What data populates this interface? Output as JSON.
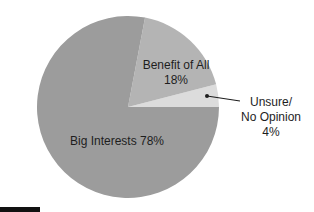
{
  "chart_data": {
    "type": "pie",
    "title": "",
    "slices": [
      {
        "label": "Big Interests",
        "value": 78,
        "display": "Big Interests 78%",
        "color": "#9c9c9c"
      },
      {
        "label": "Benefit of All",
        "value": 18,
        "display_line1": "Benefit of All",
        "display_line2": "18%",
        "color": "#b4b4b4"
      },
      {
        "label": "Unsure/ No Opinion",
        "value": 4,
        "display_line1": "Unsure/",
        "display_line2": "No Opinion",
        "display_line3": "4%",
        "color": "#dcdcdc"
      }
    ],
    "start_angle_deg": 0,
    "direction": "counterclockwise",
    "legend": "none",
    "label_style": "inline, with leader line for smallest slice"
  },
  "layout": {
    "center": [
      128,
      107
    ],
    "radius": 91,
    "leader_line_color": "#1e1e1e",
    "corner_bar_color": "#111111"
  }
}
